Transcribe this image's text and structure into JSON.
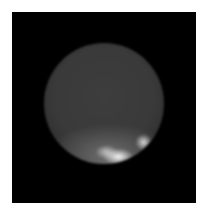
{
  "image": {
    "description": "Grayscale telescope image of a planet disk on black background with bright spots near the lower limb",
    "background_color": "#000000",
    "page_color": "#ffffff",
    "subject": "planet-disk",
    "features": [
      {
        "name": "bright-spot-center",
        "x": 104,
        "y": 152
      },
      {
        "name": "bright-spot-left",
        "x": 92,
        "y": 149
      },
      {
        "name": "bright-spot-right",
        "x": 132,
        "y": 147
      }
    ]
  }
}
